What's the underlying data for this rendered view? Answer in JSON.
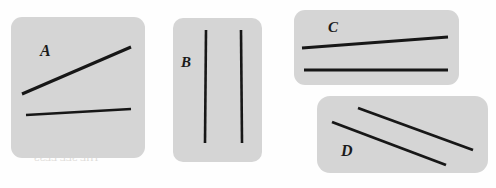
{
  "figure": {
    "canvas": {
      "width": 496,
      "height": 188
    },
    "background_color": "#fefefe",
    "panel_color": "#d5d5d5",
    "line_color": "#171717",
    "label_color": "#1b1b1b",
    "panels": [
      {
        "id": "a",
        "label": "A",
        "shape": "rounded-square",
        "lines": [
          {
            "name": "upper-line",
            "x1": 11,
            "y1": 77,
            "x2": 120,
            "y2": 30,
            "width": 3.0
          },
          {
            "name": "lower-line",
            "x1": 15,
            "y1": 98,
            "x2": 120,
            "y2": 92,
            "width": 2.6
          }
        ]
      },
      {
        "id": "b",
        "label": "B",
        "shape": "rounded-rect-tall",
        "lines": [
          {
            "name": "left-line",
            "x1": 33,
            "y1": 12,
            "x2": 32,
            "y2": 125,
            "width": 2.6
          },
          {
            "name": "right-line",
            "x1": 68,
            "y1": 12,
            "x2": 69,
            "y2": 125,
            "width": 2.6
          }
        ]
      },
      {
        "id": "c",
        "label": "C",
        "shape": "rounded-rect-wide",
        "lines": [
          {
            "name": "upper-line",
            "x1": 8,
            "y1": 38,
            "x2": 154,
            "y2": 27,
            "width": 2.8
          },
          {
            "name": "lower-line",
            "x1": 10,
            "y1": 60,
            "x2": 154,
            "y2": 60,
            "width": 2.8
          }
        ]
      },
      {
        "id": "d",
        "label": "D",
        "shape": "rounded-rect-wide",
        "lines": [
          {
            "name": "upper-line",
            "x1": 41,
            "y1": 12,
            "x2": 156,
            "y2": 54,
            "width": 2.9
          },
          {
            "name": "lower-line",
            "x1": 15,
            "y1": 26,
            "x2": 129,
            "y2": 69,
            "width": 2.9
          }
        ]
      }
    ],
    "bleed_through": [
      {
        "text": "The seen",
        "x": 20,
        "y": 86,
        "size": 13
      },
      {
        "text": "be visible",
        "x": 178,
        "y": 34,
        "size": 11
      },
      {
        "text": "notice",
        "x": 178,
        "y": 52,
        "size": 11
      },
      {
        "text": "Connecting of",
        "x": 24,
        "y": 118,
        "size": 11
      },
      {
        "text": "varieties cross-p",
        "x": 14,
        "y": 136,
        "size": 11
      },
      {
        "text": "THE SEE LESS",
        "x": 34,
        "y": 152,
        "size": 10
      },
      {
        "text": "their",
        "x": 186,
        "y": 110,
        "size": 11
      },
      {
        "text": "The",
        "x": 392,
        "y": 120,
        "size": 14
      },
      {
        "text": "THIS ONE SEVEN",
        "x": 352,
        "y": 46,
        "size": 10
      },
      {
        "text": "ACROSS IN ISOLATED",
        "x": 336,
        "y": 62,
        "size": 10
      }
    ]
  }
}
